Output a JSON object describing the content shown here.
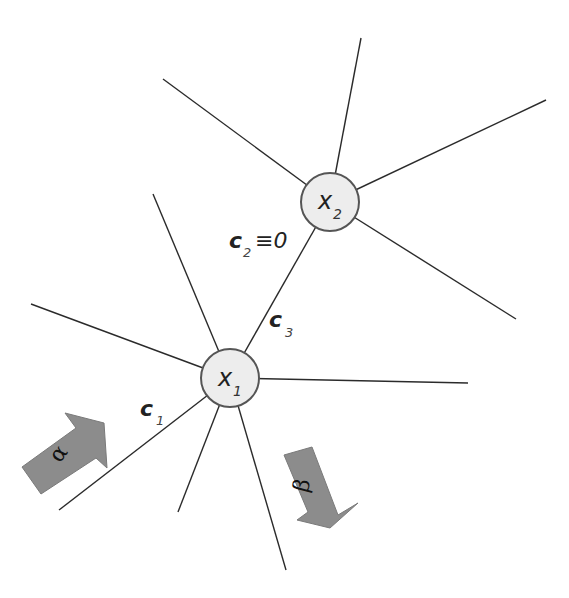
{
  "diagram": {
    "background": "#ffffff",
    "nodes": [
      {
        "id": "x1",
        "label": "x",
        "subscript": "1",
        "cx": 230,
        "cy": 378,
        "r": 29
      },
      {
        "id": "x2",
        "label": "x",
        "subscript": "2",
        "cx": 330,
        "cy": 202,
        "r": 29
      }
    ],
    "edges": {
      "x1_to_x2": {
        "from": "x1",
        "to": "x2"
      },
      "x1_spokes": [
        {
          "x": 31,
          "y": 304
        },
        {
          "x": 153,
          "y": 194
        },
        {
          "x": 468,
          "y": 383
        },
        {
          "x": 59,
          "y": 510
        },
        {
          "x": 178,
          "y": 512
        },
        {
          "x": 286,
          "y": 570
        }
      ],
      "x2_spokes": [
        {
          "x": 163,
          "y": 79
        },
        {
          "x": 361,
          "y": 38
        },
        {
          "x": 546,
          "y": 100
        },
        {
          "x": 516,
          "y": 319
        }
      ]
    },
    "edge_labels": {
      "c1": {
        "main": "c",
        "sub": "1"
      },
      "c2": {
        "main": "c",
        "sub": "2",
        "suffix": "≡0"
      },
      "c3": {
        "main": "c",
        "sub": "3"
      }
    },
    "arrows": {
      "alpha": {
        "label": "α",
        "color": "#8c8c8c"
      },
      "beta": {
        "label": "β",
        "color": "#8c8c8c"
      }
    }
  }
}
